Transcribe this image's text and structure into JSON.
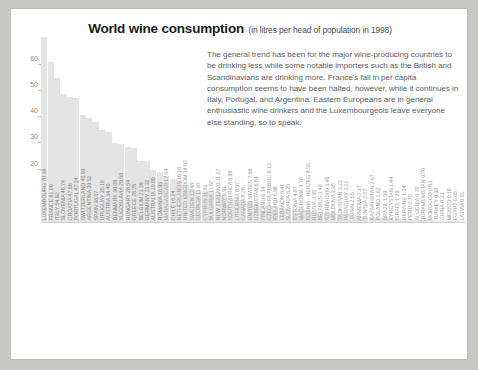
{
  "card": {
    "title": "World wine consumption",
    "subtitle": "(in litres per head of population in 1998)",
    "paragraph": "The general trend has been for the major wine-producing countries to be drinking less while some notable importers such as the British and Scandinavians are drinking more. France's fall in per capita consumption seems to have been halted, however, while it continues in Italy, Portugal, and Argentina. Eastern Europeans are in general enthusiastic wine drinkers and the Luxembourgeois leave everyone else standing, so to speak.",
    "watermark": ""
  },
  "chart_data": {
    "type": "bar",
    "title": "World wine consumption",
    "subtitle": "(in litres per head of population in 1998)",
    "xlabel": "",
    "ylabel": "litres per head of population",
    "ylim": [
      0,
      72
    ],
    "yticks": [
      20,
      30,
      40,
      50,
      60
    ],
    "grid": false,
    "bar_color": "#e4e4e4",
    "label_format": "COUNTRY VALUE (rotated 90°)",
    "categories": [
      "LUXEMBOURG",
      "FRANCE",
      "ITALY",
      "SLOVENIA",
      "CROATIA",
      "PORTUGAL",
      "SWITZERLAND",
      "ARGENTINA",
      "SPAIN",
      "URUGUAY",
      "AUSTRIA",
      "DENMARK",
      "YUGOSLAVIA",
      "HUNGARY",
      "GREECE",
      "BELGIUM",
      "GERMANY",
      "AUSTRALIA",
      "ROMANIA",
      "MADAGASCAR",
      "CHILE",
      "NETHERLANDS",
      "UNITED KINGDOM",
      "SWEDEN",
      "GEORGIA",
      "CYPRUS",
      "BULGARIA",
      "NEW ZEALAND",
      "NORWAY",
      "SOUTH AFRICA",
      "LITHUANIA",
      "CANADA",
      "UNITED STATES",
      "UZBEKISTAN",
      "FINLAND",
      "CZECH REPUBLIC",
      "IRELAND",
      "LEBANON",
      "SLOVAKIA",
      "ESTONIA",
      "MACEDONIA",
      "BOSNIA - HERZEG",
      "RUSSIA",
      "BELARUS",
      "AZERBAIJAN",
      "MOLDOVA",
      "TAJIKISTAN",
      "PARAGUAY",
      "JAPAN",
      "ARMENIA",
      "TUNISIA",
      "KAZAKHSTAN",
      "POLAND",
      "BRAZIL",
      "KYRGYSTAN",
      "ISRAEL",
      "UKRAINE",
      "PERU",
      "ALGERIA",
      "TURKMENISTAN",
      "MOROCCO",
      "TURKEY",
      "CHINA",
      "MEXICO",
      "EGYPT",
      "LATVIA"
    ],
    "values": [
      70.36,
      61.09,
      54.92,
      48.74,
      47.66,
      47.34,
      40.9,
      39.52,
      38.07,
      35.19,
      34.4,
      30.08,
      29.58,
      28.54,
      28.25,
      23.39,
      23.32,
      19.89,
      18.95,
      17.64,
      16.24,
      16.18,
      14.02,
      12.48,
      11.87,
      11.81,
      11.67,
      11.27,
      9.91,
      8.98,
      8.57,
      8.28,
      7.88,
      6.84,
      6.14,
      6.13,
      5.98,
      5.41,
      5.25,
      4.87,
      4.78,
      4.55,
      3.95,
      3.48,
      3.46,
      3.35,
      3.22,
      3.21,
      2.55,
      2.17,
      2.07,
      2.07,
      1.62,
      1.59,
      1.44,
      1.29,
      1.04,
      0.7,
      0.7,
      0.7,
      0.63,
      0.38,
      0.33,
      0.16,
      0.05,
      0.01
    ],
    "bar_labels": [
      "LUXEMBOURG 70.36",
      "FRANCE 61.09",
      "ITALY 54.92",
      "SLOVENIA 48.74",
      "CROATIA 47.66",
      "PORTUGAL 47.34",
      "SWITZERLAND 40.90",
      "ARGENTINA 39.52",
      "SPAIN 38.07",
      "URUGUAY 35.19",
      "AUSTRIA 34.40",
      "DENMARK 30.08",
      "YUGOSLAVIA 29.58",
      "HUNGARY 28.54",
      "GREECE 28.25",
      "BELGIUM 23.39",
      "GERMANY 23.32",
      "AUSTRALIA 19.89",
      "ROMANIA 18.95",
      "MADAGASCAR 17.64",
      "CHILE 16.24",
      "NETHERLANDS 16.18",
      "UNITED KINGDOM 14.02",
      "SWEDEN 12.48",
      "GEORGIA 11.87",
      "CYPRUS 11.81",
      "BULGARIA 11.67",
      "NEW ZEALAND 11.27",
      "NORWAY 9.91",
      "SOUTH AFRICA 8.98",
      "LITHUANIA 8.57",
      "CANADA 8.28",
      "UNITED STATES 7.88",
      "UZBEKISTAN 6.84",
      "FINLAND 6.14",
      "CZECH REPUBLIC 6.13",
      "IRELAND 5.98",
      "LEBANON 5.41",
      "SLOVAKIA 5.25",
      "ESTONIA 4.87",
      "MACEDONIA 4.78",
      "BOSNIA - HERZEG 4.55",
      "RUSSIA 3.95",
      "BELARUS 3.48",
      "AZERBAIJAN 3.46",
      "MOLDOVA 3.35",
      "TAJIKISTAN 3.22",
      "PARAGUAY 3.21",
      "JAPAN 2.55",
      "ARMENIA 2.17",
      "TUNISIA 2.07",
      "KAZAKHSTAN 2.07",
      "POLAND 1.62",
      "BRAZIL 1.59",
      "KYRGYSTAN 1.44",
      "ISRAEL 1.29",
      "UKRAINE 1.04",
      "PERU 0.70",
      "ALGERIA 0.70",
      "TURKMENISTAN 0.70",
      "MOROCCO 0.63",
      "TURKEY 0.38",
      "CHINA 0.33",
      "MEXICO 0.16",
      "EGYPT 0.05",
      "LATVIA 0.01"
    ]
  }
}
